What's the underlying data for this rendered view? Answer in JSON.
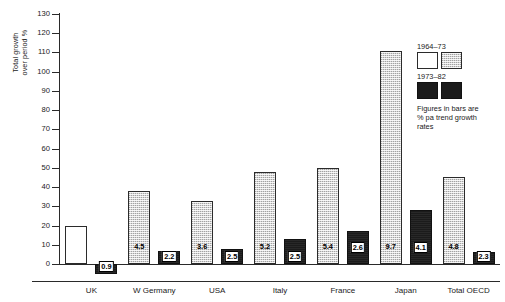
{
  "chart_data": {
    "type": "bar",
    "title": "",
    "xlabel": "",
    "ylabel": "Total growth\nover period %",
    "ylim": [
      -10,
      130
    ],
    "yticks": [
      0,
      10,
      20,
      30,
      40,
      50,
      60,
      70,
      80,
      90,
      100,
      110,
      120,
      130
    ],
    "grid": false,
    "legend_position": "top-right",
    "categories": [
      "UK",
      "W Germany",
      "USA",
      "Italy",
      "France",
      "Japan",
      "Total OECD"
    ],
    "series": [
      {
        "name": "1964–73",
        "values": [
          20,
          38,
          33,
          48,
          50,
          111,
          45
        ],
        "data_labels": [
          "",
          "4.5",
          "3.6",
          "5.2",
          "5.4",
          "9.7",
          "4.8"
        ]
      },
      {
        "name": "1973–82",
        "values": [
          -5,
          7,
          8,
          13,
          17,
          28,
          6
        ],
        "data_labels": [
          "0.9",
          "2.2",
          "2.5",
          "2.5",
          "2.6",
          "4.1",
          "2.3"
        ]
      }
    ],
    "annotations": [
      "Figures in bars are % pa trend growth rates"
    ]
  },
  "axis": {
    "y_title": "Total growth\nover period %",
    "tick_labels": [
      "130",
      "120",
      "110",
      "100",
      "90",
      "80",
      "70",
      "60",
      "50",
      "40",
      "30",
      "20",
      "10",
      "0"
    ]
  },
  "legend": {
    "first_period_label": "1964–73",
    "second_period_label": "1973–82",
    "note": "Figures in bars are\n% pa trend growth\nrates"
  },
  "colors": {
    "white_bar": "#ffffff",
    "hatched_bar": "#d6d6d6",
    "dark_bar": "#1b1b1b",
    "axis": "#2a2a2a",
    "text": "#1a1a1a"
  }
}
